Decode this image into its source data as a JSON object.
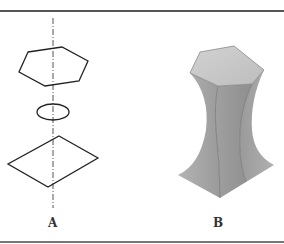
{
  "figure": {
    "panels": [
      {
        "label": "A",
        "description": "Line drawing: vertical dash-dot axis passing through a hexagon (top), a small ellipse (middle) and a rhombus/diamond (bottom)",
        "shapes": [
          "hexagon",
          "ellipse",
          "rhombus"
        ],
        "axis": "dash-dot vertical center line"
      },
      {
        "label": "B",
        "description": "Shaded 3D solid lofted from a hexagonal top through a narrow waist to a square/diamond base",
        "top_shape": "hexagon",
        "base_shape": "square"
      }
    ],
    "colors": {
      "line": "#222222",
      "axis": "#555555",
      "solid_light": "#c8c8c8",
      "solid_mid": "#a8a8a8",
      "solid_dark": "#8a8a8a",
      "rule": "#555555"
    }
  }
}
